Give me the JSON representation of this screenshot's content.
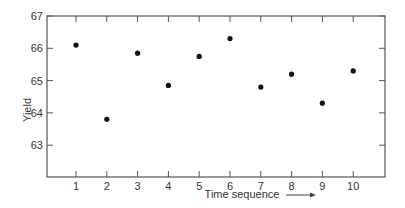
{
  "chart_data": {
    "type": "scatter",
    "title": "",
    "xlabel": "Time sequence",
    "ylabel": "Yield",
    "x": [
      1,
      2,
      3,
      4,
      5,
      6,
      7,
      8,
      9,
      10
    ],
    "series": [
      {
        "name": "Yield",
        "values": [
          66.1,
          63.8,
          65.85,
          64.85,
          65.75,
          66.3,
          64.8,
          65.2,
          64.3,
          65.3
        ]
      }
    ],
    "x_ticks": [
      "1",
      "2",
      "3",
      "4",
      "5",
      "6",
      "7",
      "8",
      "9",
      "10"
    ],
    "y_ticks": [
      "63",
      "64",
      "65",
      "66",
      "67"
    ],
    "xlim": [
      0,
      11
    ],
    "ylim": [
      62,
      67
    ],
    "grid": false,
    "legend": null,
    "annotations": [
      "arrow after x-axis label pointing right"
    ]
  },
  "colors": {
    "axis": "#555555",
    "point": "#111111",
    "text": "#333333"
  }
}
